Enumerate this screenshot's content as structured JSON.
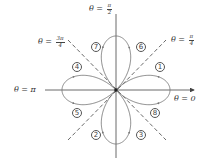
{
  "figure": {
    "origin": {
      "x": 116,
      "y": 90
    },
    "petal_radius": 54,
    "curve_color": "#666666",
    "axis_color": "#444444",
    "dash_color": "#444444"
  },
  "angle_labels": {
    "theta_0": {
      "prefix": "θ =",
      "value": "0"
    },
    "theta_pi": {
      "prefix": "θ =",
      "value": "π"
    },
    "theta_pi_2": {
      "prefix": "θ =",
      "num": "π",
      "den": "2"
    },
    "theta_pi_4": {
      "prefix": "θ =",
      "num": "π",
      "den": "4"
    },
    "theta_3pi_4": {
      "prefix": "θ =",
      "num": "3π",
      "den": "4"
    }
  },
  "segment_labels": [
    {
      "id": "1",
      "text": "1",
      "x": 160,
      "y": 62
    },
    {
      "id": "2",
      "text": "2",
      "x": 91,
      "y": 130
    },
    {
      "id": "3",
      "text": "3",
      "x": 137,
      "y": 130
    },
    {
      "id": "4",
      "text": "4",
      "x": 72,
      "y": 62
    },
    {
      "id": "5",
      "text": "5",
      "x": 72,
      "y": 110
    },
    {
      "id": "6",
      "text": "6",
      "x": 137,
      "y": 43
    },
    {
      "id": "7",
      "text": "7",
      "x": 91,
      "y": 43
    },
    {
      "id": "8",
      "text": "8",
      "x": 150,
      "y": 110
    }
  ]
}
